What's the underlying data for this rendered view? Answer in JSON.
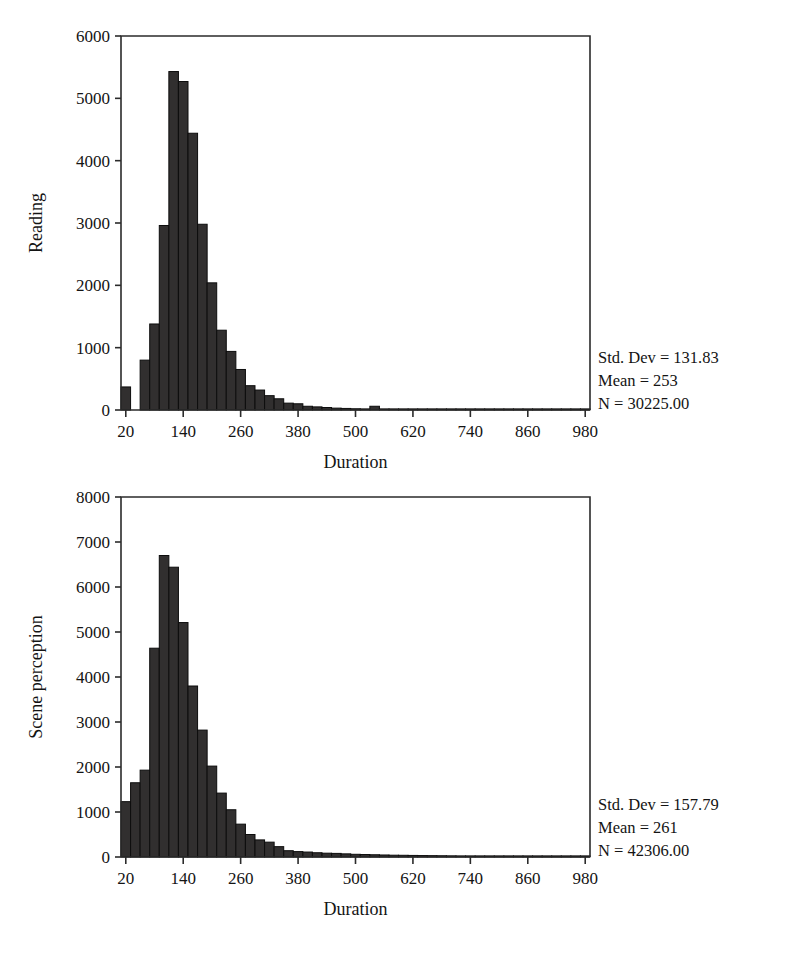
{
  "page": {
    "background_color": "#ffffff",
    "bar_color": "#312f2f",
    "axis_color": "#2b2b2b",
    "text_color": "#141414"
  },
  "charts": [
    {
      "id": "reading",
      "name": "reading-histogram",
      "ylabel": "Reading",
      "xlabel": "Duration",
      "stats": {
        "std_dev": "Std. Dev = 131.83",
        "mean": "Mean = 253",
        "n": "N = 30225.00"
      },
      "y_ticks": [
        "0",
        "1000",
        "2000",
        "3000",
        "4000",
        "5000",
        "6000"
      ],
      "x_ticks": [
        "20",
        "140",
        "260",
        "380",
        "500",
        "620",
        "740",
        "860",
        "980"
      ]
    },
    {
      "id": "scene",
      "name": "scene-perception-histogram",
      "ylabel": "Scene perception",
      "xlabel": "Duration",
      "stats": {
        "std_dev": "Std. Dev = 157.79",
        "mean": "Mean = 261",
        "n": "N = 42306.00"
      },
      "y_ticks": [
        "0",
        "1000",
        "2000",
        "3000",
        "4000",
        "5000",
        "6000",
        "7000",
        "8000"
      ],
      "x_ticks": [
        "20",
        "140",
        "260",
        "380",
        "500",
        "620",
        "740",
        "860",
        "980"
      ]
    }
  ],
  "chart_data": [
    {
      "type": "bar",
      "subtype": "histogram",
      "title": "",
      "xlabel": "Duration",
      "ylabel": "Reading",
      "xlim": [
        10,
        990
      ],
      "ylim": [
        0,
        6000
      ],
      "grid": false,
      "legend": false,
      "bin_width": 20,
      "x_tick_values": [
        20,
        140,
        260,
        380,
        500,
        620,
        740,
        860,
        980
      ],
      "y_tick_values": [
        0,
        1000,
        2000,
        3000,
        4000,
        5000,
        6000
      ],
      "annotations": [
        "Std. Dev = 131.83",
        "Mean = 253",
        "N = 30225.00"
      ],
      "statistics": {
        "std_dev": 131.83,
        "mean": 253,
        "n": 30225.0
      },
      "bin_centers": [
        20,
        40,
        60,
        80,
        100,
        120,
        140,
        160,
        180,
        200,
        220,
        240,
        260,
        280,
        300,
        320,
        340,
        360,
        380,
        400,
        420,
        440,
        460,
        480,
        500,
        520,
        540,
        560,
        580,
        600,
        620,
        640,
        660,
        680,
        700,
        720,
        740,
        760,
        780,
        800,
        820,
        840,
        860,
        880,
        900,
        920,
        940,
        960,
        980
      ],
      "values": [
        370,
        0,
        800,
        1380,
        2960,
        5430,
        5270,
        4440,
        2980,
        2040,
        1280,
        940,
        650,
        390,
        320,
        230,
        180,
        110,
        100,
        60,
        50,
        40,
        30,
        25,
        20,
        15,
        60,
        12,
        10,
        8,
        6,
        5,
        4,
        3,
        3,
        2,
        2,
        2,
        1,
        1,
        1,
        1,
        1,
        1,
        1,
        1,
        1,
        1,
        1
      ]
    },
    {
      "type": "bar",
      "subtype": "histogram",
      "title": "",
      "xlabel": "Duration",
      "ylabel": "Scene perception",
      "xlim": [
        10,
        990
      ],
      "ylim": [
        0,
        8000
      ],
      "grid": false,
      "legend": false,
      "bin_width": 20,
      "x_tick_values": [
        20,
        140,
        260,
        380,
        500,
        620,
        740,
        860,
        980
      ],
      "y_tick_values": [
        0,
        1000,
        2000,
        3000,
        4000,
        5000,
        6000,
        7000,
        8000
      ],
      "annotations": [
        "Std. Dev = 157.79",
        "Mean = 261",
        "N = 42306.00"
      ],
      "statistics": {
        "std_dev": 157.79,
        "mean": 261,
        "n": 42306.0
      },
      "bin_centers": [
        20,
        40,
        60,
        80,
        100,
        120,
        140,
        160,
        180,
        200,
        220,
        240,
        260,
        280,
        300,
        320,
        340,
        360,
        380,
        400,
        420,
        440,
        460,
        480,
        500,
        520,
        540,
        560,
        580,
        600,
        620,
        640,
        660,
        680,
        700,
        720,
        740,
        760,
        780,
        800,
        820,
        840,
        860,
        880,
        900,
        920,
        940,
        960,
        980
      ],
      "values": [
        1230,
        1650,
        1930,
        4640,
        6700,
        6440,
        5210,
        3800,
        2820,
        2020,
        1420,
        1050,
        730,
        500,
        380,
        330,
        230,
        140,
        120,
        110,
        95,
        85,
        80,
        70,
        60,
        55,
        50,
        45,
        40,
        38,
        35,
        32,
        30,
        28,
        26,
        24,
        22,
        20,
        19,
        18,
        17,
        16,
        15,
        14,
        13,
        12,
        11,
        10,
        9
      ]
    }
  ]
}
